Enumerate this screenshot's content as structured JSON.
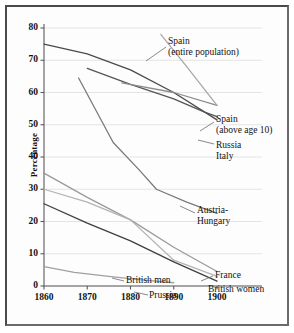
{
  "chart_data": {
    "type": "line",
    "title": "",
    "xlabel": "",
    "ylabel": "Percentage",
    "xlim": [
      1860,
      1903
    ],
    "ylim": [
      0,
      80
    ],
    "xticks": [
      "1860",
      "1870",
      "1880",
      "1890",
      "1900"
    ],
    "yticks": [
      "0",
      "10",
      "20",
      "30",
      "40",
      "50",
      "60",
      "70",
      "80"
    ],
    "grid": "horizontal",
    "legend_position": "inline-right",
    "series": [
      {
        "name": "Italy",
        "label": "Italy",
        "color": "#4a4a4a",
        "points": [
          [
            1860,
            75.0
          ],
          [
            1870,
            72.0
          ],
          [
            1880,
            67.0
          ],
          [
            1890,
            60.0
          ],
          [
            1900,
            51.5
          ]
        ]
      },
      {
        "name": "Russia",
        "label": "Russia",
        "color": "#555555",
        "points": [
          [
            1870,
            67.5
          ],
          [
            1880,
            62.5
          ],
          [
            1890,
            58.0
          ],
          [
            1897,
            54.0
          ],
          [
            1900,
            52.5
          ]
        ]
      },
      {
        "name": "Spain (above age 10)",
        "label": "Spain\n(above age 10)",
        "label_line1": "Spain",
        "label_line2": "(above age 10)",
        "color": "#8c8c8c",
        "points": [
          [
            1878,
            63.0
          ],
          [
            1890,
            60.0
          ],
          [
            1900,
            56.0
          ]
        ]
      },
      {
        "name": "Spain (entire population)",
        "label": "Spain\n(entire population)",
        "label_line1": "Spain",
        "label_line2": "(entire population)",
        "color": "#a8a8a8",
        "points": [
          [
            1887,
            78.0
          ],
          [
            1893,
            68.0
          ],
          [
            1900,
            56.0
          ]
        ]
      },
      {
        "name": "Austria-Hungary",
        "label": "Austria-\nHungary",
        "label_line1": "Austria-",
        "label_line2": "Hungary",
        "color": "#7a7a7a",
        "points": [
          [
            1868,
            64.5
          ],
          [
            1876,
            44.5
          ],
          [
            1882,
            36.0
          ],
          [
            1886,
            30.0
          ],
          [
            1893,
            26.0
          ],
          [
            1900,
            22.5
          ]
        ]
      },
      {
        "name": "France",
        "label": "France",
        "color": "#9a9a9a",
        "points": [
          [
            1860,
            35.0
          ],
          [
            1870,
            27.5
          ],
          [
            1880,
            20.5
          ],
          [
            1890,
            12.0
          ],
          [
            1900,
            4.5
          ]
        ]
      },
      {
        "name": "British women",
        "label": "British women",
        "color": "#b4b4b4",
        "points": [
          [
            1860,
            30.0
          ],
          [
            1870,
            26.0
          ],
          [
            1880,
            20.5
          ],
          [
            1890,
            8.0
          ],
          [
            1900,
            3.0
          ]
        ]
      },
      {
        "name": "British men",
        "label": "British men",
        "color": "#3f3f3f",
        "points": [
          [
            1860,
            25.5
          ],
          [
            1870,
            19.5
          ],
          [
            1880,
            14.0
          ],
          [
            1890,
            7.5
          ],
          [
            1900,
            1.5
          ]
        ]
      },
      {
        "name": "Prussia",
        "label": "Prussia",
        "color": "#a0a0a0",
        "points": [
          [
            1860,
            6.0
          ],
          [
            1867,
            4.2
          ],
          [
            1875,
            3.0
          ],
          [
            1882,
            2.0
          ],
          [
            1890,
            1.0
          ]
        ]
      }
    ],
    "annotations": [
      {
        "name": "spain-entire-population",
        "line1": "Spain",
        "line2": "(entire population)"
      },
      {
        "name": "spain-above-age-10",
        "line1": "Spain",
        "line2": "(above age 10)"
      },
      {
        "name": "russia",
        "line1": "Russia"
      },
      {
        "name": "italy",
        "line1": "Italy"
      },
      {
        "name": "austria-hungary",
        "line1": "Austria-",
        "line2": "Hungary"
      },
      {
        "name": "france",
        "line1": "France"
      },
      {
        "name": "british-women",
        "line1": "British women"
      },
      {
        "name": "british-men",
        "line1": "British men"
      },
      {
        "name": "prussia",
        "line1": "Prussia"
      }
    ]
  },
  "axis": {
    "y_label": "Percentage",
    "y_ticks": [
      "80",
      "70",
      "60",
      "50",
      "40",
      "30",
      "20",
      "10",
      "0"
    ],
    "x_ticks": [
      "1860",
      "1870",
      "1880",
      "1890",
      "1900"
    ]
  },
  "labels": {
    "spain_entire_1": "Spain",
    "spain_entire_2": "(entire population)",
    "spain_above_1": "Spain",
    "spain_above_2": "(above age 10)",
    "russia": "Russia",
    "italy": "Italy",
    "austria_1": "Austria-",
    "austria_2": "Hungary",
    "france": "France",
    "british_women": "British women",
    "british_men": "British men",
    "prussia": "Prussia"
  },
  "colors": {
    "frame": "#4a4a4a",
    "grid": "#e4e4e4",
    "axis": "#5a5a5a",
    "background": "#fdfdfd"
  }
}
